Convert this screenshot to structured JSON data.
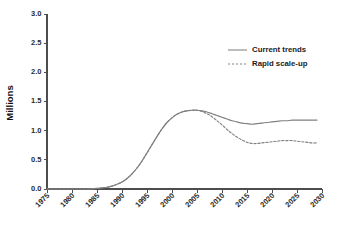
{
  "chart_data": {
    "type": "line",
    "title": "",
    "xlabel": "",
    "ylabel": "Millions",
    "xlim": [
      1975,
      2030
    ],
    "ylim": [
      0.0,
      3.0
    ],
    "grid": false,
    "legend_position": "top-right",
    "xticks": [
      "1975",
      "1980",
      "1985",
      "1990",
      "1995",
      "2000",
      "2005",
      "2010",
      "2015",
      "2020",
      "2025",
      "2030"
    ],
    "yticks": [
      "0.0",
      "0.5",
      "1.0",
      "1.5",
      "2.0",
      "2.5",
      "3.0"
    ],
    "x": [
      1975,
      1977,
      1979,
      1981,
      1983,
      1985,
      1986,
      1987,
      1988,
      1989,
      1990,
      1991,
      1992,
      1993,
      1994,
      1995,
      1996,
      1997,
      1998,
      1999,
      2000,
      2001,
      2002,
      2003,
      2004,
      2005,
      2006,
      2007,
      2008,
      2009,
      2010,
      2011,
      2012,
      2013,
      2014,
      2015,
      2016,
      2017,
      2018,
      2019,
      2020,
      2021,
      2022,
      2023,
      2024,
      2025,
      2026,
      2027,
      2028,
      2029
    ],
    "series": [
      {
        "name": "Current trends",
        "style": "solid",
        "color": "#808080",
        "values": [
          0.0,
          0.0,
          0.0,
          0.0,
          0.0,
          0.01,
          0.02,
          0.03,
          0.05,
          0.08,
          0.12,
          0.18,
          0.26,
          0.36,
          0.48,
          0.62,
          0.76,
          0.9,
          1.03,
          1.14,
          1.22,
          1.28,
          1.32,
          1.34,
          1.35,
          1.35,
          1.34,
          1.32,
          1.29,
          1.26,
          1.23,
          1.2,
          1.17,
          1.15,
          1.13,
          1.12,
          1.11,
          1.12,
          1.13,
          1.14,
          1.15,
          1.16,
          1.17,
          1.17,
          1.18,
          1.18,
          1.18,
          1.18,
          1.18,
          1.18
        ]
      },
      {
        "name": "Rapid scale-up",
        "style": "dashed",
        "color": "#808080",
        "values": [
          0.0,
          0.0,
          0.0,
          0.0,
          0.0,
          0.01,
          0.02,
          0.03,
          0.05,
          0.08,
          0.12,
          0.18,
          0.26,
          0.36,
          0.48,
          0.62,
          0.76,
          0.9,
          1.03,
          1.14,
          1.22,
          1.28,
          1.32,
          1.34,
          1.35,
          1.35,
          1.33,
          1.29,
          1.24,
          1.17,
          1.1,
          1.02,
          0.95,
          0.89,
          0.84,
          0.8,
          0.78,
          0.78,
          0.79,
          0.8,
          0.81,
          0.82,
          0.83,
          0.83,
          0.83,
          0.82,
          0.81,
          0.8,
          0.79,
          0.79
        ]
      }
    ],
    "legend": [
      {
        "label": "Current trends",
        "style": "solid"
      },
      {
        "label": "Rapid scale-up",
        "style": "dashed"
      }
    ]
  }
}
